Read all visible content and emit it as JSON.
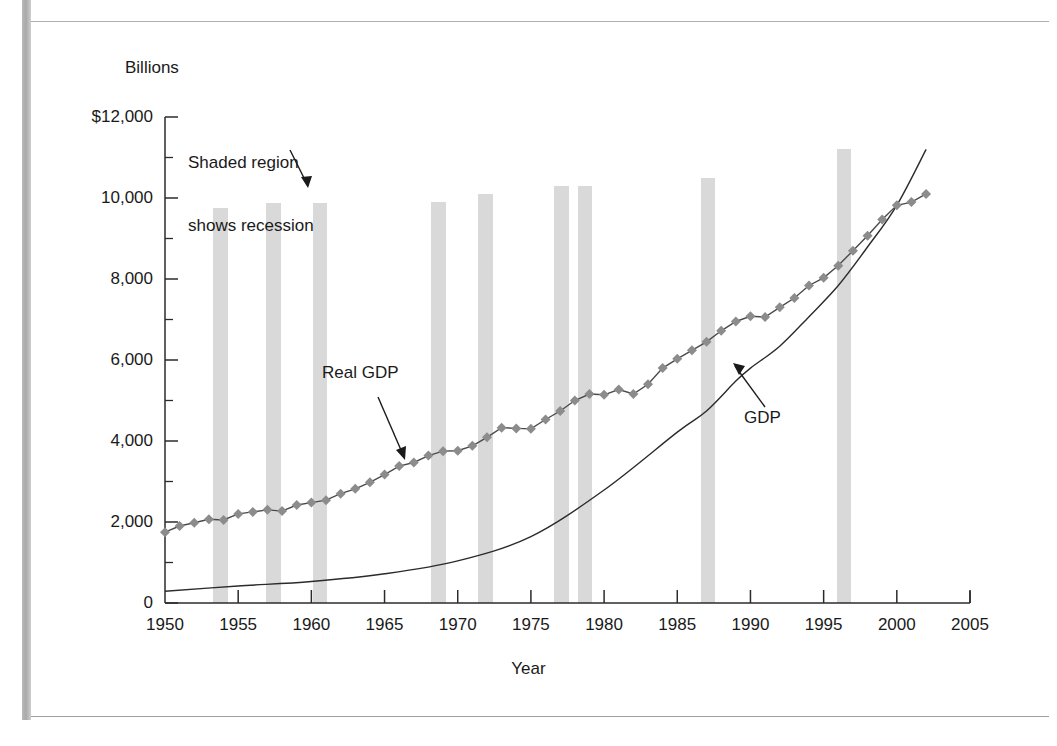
{
  "page": {
    "clipped_caption_fragment": "",
    "background": "#ffffff",
    "rule_color": "#b0b0b0"
  },
  "annotations": {
    "recession_note_line1": "Shaded region",
    "recession_note_line2": "shows recession",
    "real_gdp_label": "Real GDP",
    "gdp_label": "GDP"
  },
  "chart_data": {
    "type": "line",
    "title": "",
    "subtitle": "",
    "xlabel": "Year",
    "ylabel": "Billions",
    "xlim": [
      1950,
      2005
    ],
    "ylim": [
      0,
      12000
    ],
    "grid": false,
    "legend_position": "inline-annotations",
    "y_tick_labels": [
      "$12,000",
      "10,000",
      "8,000",
      "6,000",
      "4,000",
      "2,000",
      "0"
    ],
    "y_ticks": [
      12000,
      10000,
      8000,
      6000,
      4000,
      2000,
      0
    ],
    "y_minor_ticks": [
      11000,
      9000,
      7000,
      5000,
      3000,
      1000
    ],
    "x_tick_labels": [
      "1950",
      "1955",
      "1960",
      "1965",
      "1970",
      "1975",
      "1980",
      "1985",
      "1990",
      "1995",
      "2000",
      "2005"
    ],
    "x_ticks": [
      1950,
      1955,
      1960,
      1965,
      1970,
      1975,
      1980,
      1985,
      1990,
      1995,
      2000,
      2005
    ],
    "colors": {
      "real_gdp_marker": "#8c8c8c",
      "real_gdp_line": "#4a4a4a",
      "gdp_line": "#2b2b2b",
      "recession_shading": "#d9d9d9",
      "axis": "#2b2b2b"
    },
    "series": [
      {
        "name": "Real GDP",
        "style": "line-with-diamond-markers",
        "x": [
          1950,
          1951,
          1952,
          1953,
          1954,
          1955,
          1956,
          1957,
          1958,
          1959,
          1960,
          1961,
          1962,
          1963,
          1964,
          1965,
          1966,
          1967,
          1968,
          1969,
          1970,
          1971,
          1972,
          1973,
          1974,
          1975,
          1976,
          1977,
          1978,
          1979,
          1980,
          1981,
          1982,
          1983,
          1984,
          1985,
          1986,
          1987,
          1988,
          1989,
          1990,
          1991,
          1992,
          1993,
          1994,
          1995,
          1996,
          1997,
          1998,
          1999,
          2000,
          2001,
          2002
        ],
        "values": [
          1750,
          1900,
          1980,
          2070,
          2050,
          2200,
          2250,
          2300,
          2270,
          2420,
          2480,
          2540,
          2700,
          2820,
          2980,
          3170,
          3380,
          3470,
          3640,
          3750,
          3760,
          3880,
          4090,
          4330,
          4310,
          4300,
          4530,
          4740,
          5000,
          5160,
          5140,
          5270,
          5160,
          5400,
          5800,
          6030,
          6240,
          6450,
          6720,
          6950,
          7080,
          7060,
          7300,
          7530,
          7840,
          8030,
          8330,
          8700,
          9070,
          9470,
          9820,
          9900,
          10100
        ]
      },
      {
        "name": "GDP",
        "style": "thin-line",
        "x": [
          1950,
          1955,
          1960,
          1965,
          1970,
          1975,
          1980,
          1985,
          1987,
          1989,
          1990,
          1992,
          1994,
          1996,
          1998,
          2000,
          2002
        ],
        "values": [
          290,
          420,
          530,
          720,
          1040,
          1640,
          2790,
          4220,
          4740,
          5480,
          5800,
          6340,
          7070,
          7840,
          8790,
          9820,
          11200
        ]
      }
    ],
    "recession_bands": [
      {
        "start": 1953.3,
        "end": 1954.3,
        "top_value": 9750
      },
      {
        "start": 1956.9,
        "end": 1957.9,
        "top_value": 9880
      },
      {
        "start": 1960.1,
        "end": 1961.1,
        "top_value": 9880
      },
      {
        "start": 1968.2,
        "end": 1969.2,
        "top_value": 9900
      },
      {
        "start": 1971.4,
        "end": 1972.4,
        "top_value": 10100
      },
      {
        "start": 1976.6,
        "end": 1977.6,
        "top_value": 10300
      },
      {
        "start": 1178.2,
        "end": 1179.2,
        "top_value": 10300
      },
      {
        "start": 1186.6,
        "end": 1187.6,
        "top_value": 10500
      },
      {
        "start": 1195.9,
        "end": 1196.9,
        "top_value": 11200
      }
    ]
  }
}
